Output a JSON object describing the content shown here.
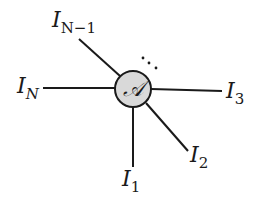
{
  "diagram": {
    "type": "tensor-network-node",
    "center_node": {
      "label": "𝒜",
      "fill": "#d9d9d9",
      "stroke": "#1a1a1a",
      "cx": 133,
      "cy": 89,
      "r": 18
    },
    "ellipsis": "⋱",
    "legs": [
      {
        "id": "leg-n-minus-1",
        "label_main": "I",
        "label_sub": "N−1",
        "x1": 120,
        "y1": 76,
        "x2": 79,
        "y2": 39,
        "lx": 52,
        "ly": 27
      },
      {
        "id": "leg-n",
        "label_main": "I",
        "label_sub": "N",
        "x1": 115,
        "y1": 88,
        "x2": 43,
        "y2": 88,
        "lx": 17,
        "ly": 93
      },
      {
        "id": "leg-3",
        "label_main": "I",
        "label_sub": "3",
        "x1": 151,
        "y1": 89,
        "x2": 222,
        "y2": 91,
        "lx": 226,
        "ly": 98
      },
      {
        "id": "leg-2",
        "label_main": "I",
        "label_sub": "2",
        "x1": 146,
        "y1": 103,
        "x2": 188,
        "y2": 151,
        "lx": 190,
        "ly": 162
      },
      {
        "id": "leg-1",
        "label_main": "I",
        "label_sub": "1",
        "x1": 133,
        "y1": 107,
        "x2": 133,
        "y2": 167,
        "lx": 122,
        "ly": 186
      }
    ]
  }
}
